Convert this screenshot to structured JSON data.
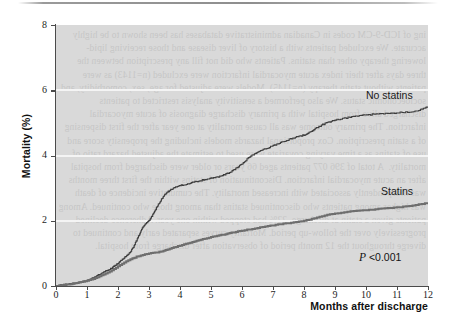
{
  "figure": {
    "top_rule": "horizontal-rule",
    "ghost_text": "ing of ICD-9-CM codes in Canadian administrative databases has been shown to be highly accurate. We excluded patients with a history of liver disease and those receiving lipid-lowering therapy other than statins. Patients who did not fill any prescription between the three days after their index acute myocardial infarction were excluded (n=1143) as were patients without statin therapy (n=1145). Models were adjusted for age, sex, comorbidity, and socioeconomic status. We also performed a sensitivity analysis restricted to patients discharged alive from hospital with a primary discharge diagnosis of acute myocardial infarction. The primary outcome was all cause mortality at one year after the first dispensing of a statin prescription. Cox proportional hazards models including the propensity score and use of statins as a time varying covariate were used to estimate the adjusted hazard ratio of mortality.  A total of 396 077 patients aged 66 years or older were discharged from hospital after an acute myocardial infarction. Discontinuation of statins within the first three months was independently associated with increased mortality. The cumulative incidence of death was higher among patients who discontinued statins than among those who continued. Among patients given a statin at discharge, 22% had stopped within one year. Adherence declined progressively over the follow-up period. Mortality curves separated early and continued to diverge throughout the 12 month period of observation after discharge from hospital."
  },
  "chart_data": {
    "type": "line",
    "title": "",
    "xlabel": "Months after discharge",
    "ylabel": "Mortality (%)",
    "xlim": [
      0,
      12
    ],
    "ylim": [
      0,
      8
    ],
    "xticks": [
      0,
      1,
      2,
      3,
      4,
      5,
      6,
      7,
      8,
      9,
      10,
      11,
      12
    ],
    "yticks": [
      0,
      2,
      4,
      6,
      8
    ],
    "grid": "horizontal-white-gridlines-at-2-4-6",
    "legend_position": "inline-right",
    "annotations": [
      {
        "name": "p-value",
        "text_prefix": "P",
        "text_rest": " <0.001",
        "x": 11.0,
        "y": 1.05
      }
    ],
    "series": [
      {
        "name": "No statins",
        "color": "#3d3d3d",
        "line_width": 1.1,
        "style": "step",
        "label_x": 10.4,
        "label_y": 6.05,
        "x": [
          0.0,
          0.15,
          0.3,
          0.45,
          0.6,
          0.75,
          0.9,
          1.0,
          1.1,
          1.2,
          1.3,
          1.4,
          1.5,
          1.6,
          1.7,
          1.8,
          1.9,
          2.0,
          2.1,
          2.2,
          2.3,
          2.4,
          2.5,
          2.6,
          2.7,
          2.8,
          2.9,
          3.0,
          3.1,
          3.2,
          3.3,
          3.4,
          3.5,
          3.6,
          3.7,
          3.8,
          3.9,
          4.0,
          4.2,
          4.4,
          4.6,
          4.8,
          5.0,
          5.2,
          5.4,
          5.6,
          5.8,
          6.0,
          6.2,
          6.4,
          6.6,
          6.8,
          7.0,
          7.2,
          7.4,
          7.6,
          7.8,
          8.0,
          8.2,
          8.4,
          8.6,
          8.8,
          9.0,
          9.3,
          9.6,
          9.9,
          10.2,
          10.5,
          10.8,
          11.1,
          11.4,
          11.7,
          11.85,
          12.0
        ],
        "y": [
          0.0,
          0.02,
          0.04,
          0.06,
          0.08,
          0.11,
          0.14,
          0.16,
          0.2,
          0.25,
          0.3,
          0.35,
          0.4,
          0.45,
          0.5,
          0.55,
          0.62,
          0.7,
          0.78,
          0.86,
          0.95,
          1.05,
          1.2,
          1.4,
          1.6,
          1.8,
          1.92,
          2.0,
          2.15,
          2.32,
          2.5,
          2.65,
          2.78,
          2.88,
          2.95,
          3.0,
          3.05,
          3.08,
          3.12,
          3.18,
          3.22,
          3.26,
          3.3,
          3.34,
          3.4,
          3.48,
          3.6,
          3.75,
          3.92,
          4.05,
          4.15,
          4.22,
          4.3,
          4.38,
          4.45,
          4.52,
          4.58,
          4.63,
          4.72,
          4.85,
          4.95,
          5.02,
          5.08,
          5.14,
          5.2,
          5.23,
          5.26,
          5.28,
          5.3,
          5.32,
          5.34,
          5.38,
          5.45,
          5.48
        ]
      },
      {
        "name": "Statins",
        "color": "#6e6e6e",
        "line_width": 2.0,
        "style": "step",
        "label_x": 10.6,
        "label_y": 3.02,
        "x": [
          0.0,
          0.2,
          0.4,
          0.6,
          0.8,
          1.0,
          1.2,
          1.4,
          1.6,
          1.8,
          2.0,
          2.2,
          2.4,
          2.6,
          2.8,
          3.0,
          3.2,
          3.4,
          3.6,
          3.8,
          4.0,
          4.2,
          4.4,
          4.6,
          4.8,
          5.0,
          5.2,
          5.4,
          5.6,
          5.8,
          6.0,
          6.25,
          6.5,
          6.75,
          7.0,
          7.25,
          7.5,
          7.75,
          8.0,
          8.25,
          8.5,
          8.75,
          9.0,
          9.3,
          9.6,
          9.9,
          10.2,
          10.5,
          10.8,
          11.1,
          11.4,
          11.7,
          12.0
        ],
        "y": [
          0.0,
          0.02,
          0.05,
          0.08,
          0.12,
          0.16,
          0.22,
          0.3,
          0.38,
          0.48,
          0.6,
          0.72,
          0.82,
          0.9,
          0.95,
          1.0,
          1.02,
          1.06,
          1.12,
          1.18,
          1.24,
          1.3,
          1.35,
          1.4,
          1.45,
          1.5,
          1.54,
          1.58,
          1.62,
          1.66,
          1.7,
          1.74,
          1.78,
          1.82,
          1.86,
          1.9,
          1.93,
          1.96,
          2.0,
          2.06,
          2.12,
          2.18,
          2.22,
          2.26,
          2.3,
          2.32,
          2.34,
          2.38,
          2.4,
          2.42,
          2.45,
          2.5,
          2.55
        ]
      }
    ]
  }
}
